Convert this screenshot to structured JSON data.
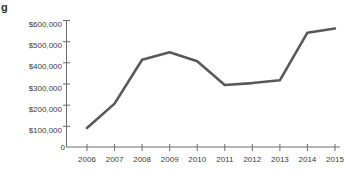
{
  "stray_text": "g",
  "chart_data": {
    "type": "line",
    "title": "",
    "subtitle": "",
    "xlabel": "",
    "ylabel": "",
    "categories": [
      "2006",
      "2007",
      "2008",
      "2009",
      "2010",
      "2011",
      "2012",
      "2013",
      "2014",
      "2015"
    ],
    "values": [
      90000,
      205000,
      412000,
      448000,
      405000,
      293000,
      302000,
      315000,
      540000,
      560000
    ],
    "series": [
      {
        "name": "",
        "values": [
          90000,
          205000,
          412000,
          448000,
          405000,
          293000,
          302000,
          315000,
          540000,
          560000
        ]
      }
    ],
    "ylim": [
      0,
      600000
    ],
    "yticks": [
      0,
      100000,
      200000,
      300000,
      400000,
      500000,
      600000
    ],
    "ytick_labels": [
      "0",
      "$100,000",
      "$200,000",
      "$300,000",
      "$400,000",
      "$500,000",
      "$600,000"
    ],
    "xtick_labels": [
      "2006",
      "2007",
      "2008",
      "2009",
      "2010",
      "2011",
      "2012",
      "2013",
      "2014",
      "2015"
    ],
    "grid": false,
    "legend": "none",
    "line_color": "#595959",
    "axis_color": "#6b6b6b"
  }
}
